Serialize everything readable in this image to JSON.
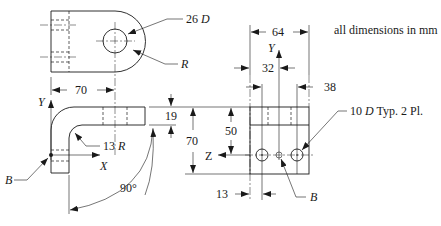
{
  "note": "all dimensions in mm",
  "top_view": {
    "hole_label_value": "26",
    "hole_label_unit": "D",
    "radius_label": "R"
  },
  "front_view": {
    "width_dim": "70",
    "bend_radius_value": "13",
    "bend_radius_unit": "R",
    "angle": "90°",
    "axis_y": "Y",
    "axis_x": "X",
    "point_label": "B",
    "thickness_dim": "19",
    "height_dim": "70"
  },
  "side_view": {
    "width_dim": "64",
    "half_dim": "32",
    "hole_spacing_dim": "38",
    "hole_height_dim": "50",
    "offset_dim": "13",
    "axis_y": "Y",
    "axis_z": "Z",
    "hole_label_value": "10",
    "hole_label_unit": "D",
    "hole_label_note": "Typ. 2 Pl.",
    "point_label": "B"
  }
}
